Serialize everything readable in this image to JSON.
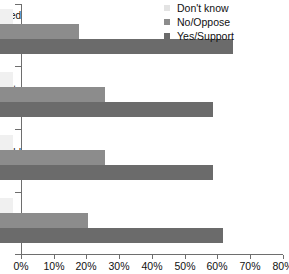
{
  "chart_data": {
    "type": "bar",
    "orientation": "horizontal",
    "title": "",
    "xlabel": "",
    "ylabel": "",
    "xlim": [
      0,
      80
    ],
    "grid": false,
    "legend_position": "top-right",
    "xticks": [
      "0%",
      "10%",
      "20%",
      "30%",
      "40%",
      "50%",
      "60%",
      "70%",
      "80%"
    ],
    "xtick_values": [
      0,
      10,
      20,
      30,
      40,
      50,
      60,
      70,
      80
    ],
    "categories": [
      "ed\ng\nd",
      "ity",
      "uld",
      ""
    ],
    "category_lines": [
      [
        "ed",
        "g",
        "d"
      ],
      [
        "ity"
      ],
      [
        "uld"
      ],
      [
        ""
      ]
    ],
    "series": [
      {
        "name": "Don't know",
        "color": "#f0f0f0",
        "values": [
          4,
          4,
          4,
          4
        ]
      },
      {
        "name": "No/Oppose",
        "color": "#8c8c8c",
        "values": [
          24,
          32,
          32,
          27
        ]
      },
      {
        "name": "Yes/Support",
        "color": "#6b6b6b",
        "values": [
          71,
          65,
          65,
          68
        ]
      }
    ]
  },
  "legend": {
    "items": [
      {
        "label": "Don't know"
      },
      {
        "label": "No/Oppose"
      },
      {
        "label": "Yes/Support"
      }
    ]
  },
  "axis": {
    "x_tick_labels": [
      "0%",
      "10%",
      "20%",
      "30%",
      "40%",
      "50%",
      "60%",
      "70%",
      "80%"
    ],
    "y_category_labels": [
      {
        "lines": [
          "ed",
          "g",
          "d"
        ]
      },
      {
        "lines": [
          "ity"
        ]
      },
      {
        "lines": [
          "uld"
        ]
      },
      {
        "lines": [
          ""
        ]
      }
    ]
  }
}
